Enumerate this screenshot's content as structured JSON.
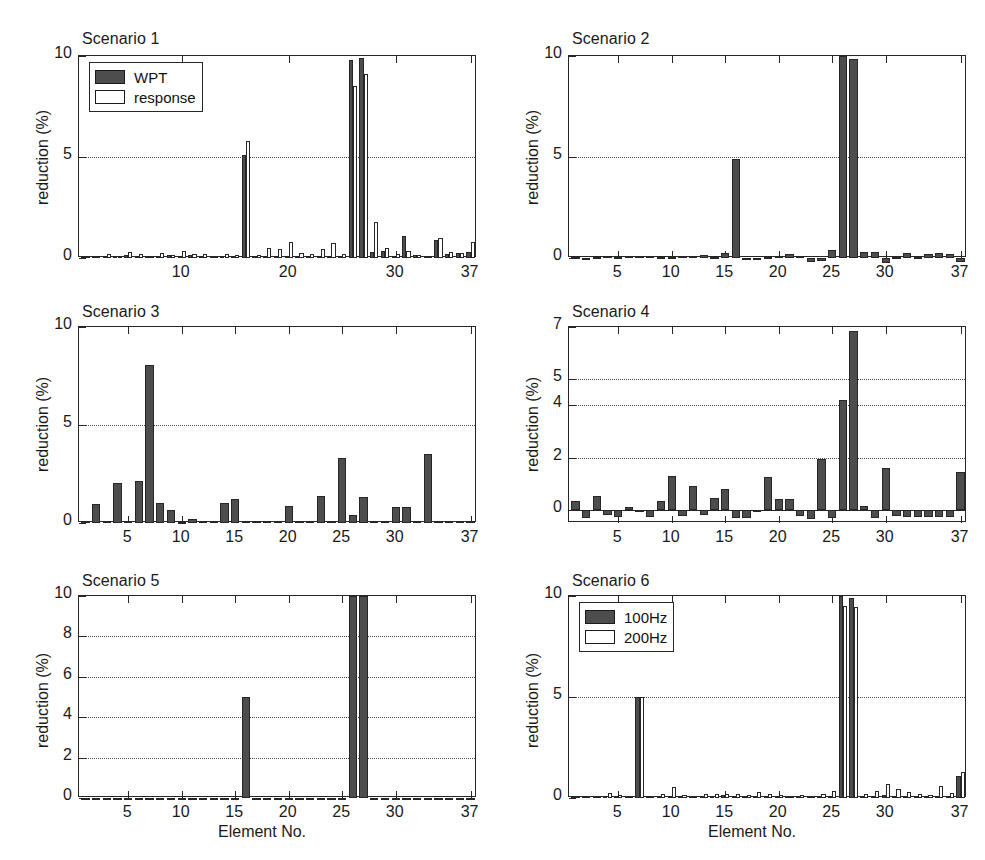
{
  "figure": {
    "width": 985,
    "height": 860,
    "background": "#ffffff",
    "bar_dark_color": "#4d4d4d",
    "bar_light_color": "#ffffff",
    "axis_color": "#262626",
    "grid_color": "#4a4a4a"
  },
  "common": {
    "ylabel": "reduction (%)",
    "xlabel": "Element No.",
    "n_elements": 37
  },
  "chart_data": [
    {
      "type": "bar",
      "title": "Scenario 1",
      "xlabel": "",
      "ylabel": "reduction (%)",
      "ylim": [
        0,
        10
      ],
      "yticks": [
        0,
        5,
        10
      ],
      "ytick_labels": [
        "0",
        "5",
        "10"
      ],
      "xlim": [
        0.4,
        37.6
      ],
      "xticks": [
        10,
        20,
        30,
        37
      ],
      "xtick_labels": [
        "10",
        "20",
        "30",
        "37"
      ],
      "grid": true,
      "gridlines_y": [
        5
      ],
      "legend": {
        "position": "top-left",
        "entries": [
          {
            "label": "WPT",
            "fill": "dark"
          },
          {
            "label": "response",
            "fill": "light"
          }
        ]
      },
      "categories": [
        1,
        2,
        3,
        4,
        5,
        6,
        7,
        8,
        9,
        10,
        11,
        12,
        13,
        14,
        15,
        16,
        17,
        18,
        19,
        20,
        21,
        22,
        23,
        24,
        25,
        26,
        27,
        28,
        29,
        30,
        31,
        32,
        33,
        34,
        35,
        36,
        37
      ],
      "series": [
        {
          "name": "WPT",
          "fill": "dark",
          "values": [
            0.1,
            0.12,
            0.08,
            0.1,
            0.15,
            0.1,
            0.12,
            0.09,
            0.13,
            0.1,
            0.14,
            0.12,
            0.1,
            0.11,
            0.09,
            5.1,
            0.1,
            0.12,
            0.1,
            0.09,
            0.11,
            0.1,
            0.1,
            0.12,
            0.1,
            9.8,
            9.9,
            0.3,
            0.35,
            0.12,
            1.1,
            0.15,
            0.1,
            0.9,
            0.2,
            0.25,
            0.3
          ]
        },
        {
          "name": "response",
          "fill": "light",
          "values": [
            0.08,
            0.1,
            0.2,
            0.12,
            0.3,
            0.18,
            0.12,
            0.25,
            0.15,
            0.35,
            0.2,
            0.18,
            0.12,
            0.22,
            0.15,
            5.8,
            0.15,
            0.5,
            0.45,
            0.8,
            0.25,
            0.2,
            0.45,
            0.75,
            0.2,
            8.5,
            9.1,
            1.8,
            0.5,
            0.2,
            0.35,
            0.15,
            0.1,
            1.0,
            0.3,
            0.25,
            0.8
          ]
        }
      ]
    },
    {
      "type": "bar",
      "title": "Scenario 2",
      "xlabel": "",
      "ylabel": "reduction (%)",
      "ylim": [
        0,
        10
      ],
      "yticks": [
        0,
        5,
        10
      ],
      "ytick_labels": [
        "0",
        "5",
        "10"
      ],
      "xlim": [
        0.4,
        37.6
      ],
      "xticks": [
        5,
        10,
        15,
        20,
        25,
        30,
        37
      ],
      "xtick_labels": [
        "5",
        "10",
        "15",
        "20",
        "25",
        "30",
        "37"
      ],
      "grid": true,
      "gridlines_y": [
        5
      ],
      "legend": null,
      "categories": [
        1,
        2,
        3,
        4,
        5,
        6,
        7,
        8,
        9,
        10,
        11,
        12,
        13,
        14,
        15,
        16,
        17,
        18,
        19,
        20,
        21,
        22,
        23,
        24,
        25,
        26,
        27,
        28,
        29,
        30,
        31,
        32,
        33,
        34,
        35,
        36,
        37
      ],
      "series": [
        {
          "name": "reduction",
          "fill": "dark",
          "values": [
            0.05,
            -0.05,
            0.05,
            0.1,
            0.05,
            0.08,
            0.1,
            0.12,
            0.05,
            0.05,
            0.08,
            0.12,
            0.15,
            0.05,
            0.25,
            4.9,
            -0.12,
            -0.1,
            0.05,
            0.1,
            0.18,
            0.1,
            -0.18,
            -0.15,
            0.4,
            10.0,
            9.85,
            0.3,
            0.28,
            -0.25,
            0.05,
            0.25,
            0.05,
            0.22,
            0.25,
            0.18,
            -0.2
          ]
        }
      ]
    },
    {
      "type": "bar",
      "title": "Scenario 3",
      "xlabel": "",
      "ylabel": "reduction (%)",
      "ylim": [
        0,
        10
      ],
      "yticks": [
        0,
        5,
        10
      ],
      "ytick_labels": [
        "0",
        "5",
        "10"
      ],
      "xlim": [
        0.4,
        37.6
      ],
      "xticks": [
        5,
        10,
        15,
        20,
        25,
        30,
        37
      ],
      "xtick_labels": [
        "5",
        "10",
        "15",
        "20",
        "25",
        "30",
        "37"
      ],
      "grid": true,
      "gridlines_y": [
        5
      ],
      "legend": null,
      "categories": [
        1,
        2,
        3,
        4,
        5,
        6,
        7,
        8,
        9,
        10,
        11,
        12,
        13,
        14,
        15,
        16,
        17,
        18,
        19,
        20,
        21,
        22,
        23,
        24,
        25,
        26,
        27,
        28,
        29,
        30,
        31,
        32,
        33,
        34,
        35,
        36,
        37
      ],
      "series": [
        {
          "name": "reduction",
          "fill": "dark",
          "values": [
            0.08,
            0.95,
            0.1,
            2.05,
            0.08,
            2.15,
            8.05,
            1.0,
            0.65,
            0.05,
            0.18,
            0.12,
            0.1,
            1.0,
            1.25,
            0.08,
            0.08,
            0.1,
            0.08,
            0.85,
            0.08,
            0.1,
            1.4,
            0.1,
            3.3,
            0.4,
            1.35,
            0.1,
            0.12,
            0.8,
            0.8,
            0.08,
            3.5,
            0.1,
            0.1,
            0.1,
            0.08
          ]
        }
      ]
    },
    {
      "type": "bar",
      "title": "Scenario 4",
      "xlabel": "",
      "ylabel": "reduction (%)",
      "ylim": [
        -0.5,
        7
      ],
      "yticks": [
        0,
        2,
        4,
        5,
        7
      ],
      "ytick_labels": [
        "0",
        "2",
        "4",
        "5",
        "7"
      ],
      "xlim": [
        0.4,
        37.6
      ],
      "xticks": [
        5,
        10,
        15,
        20,
        25,
        30,
        37
      ],
      "xtick_labels": [
        "5",
        "10",
        "15",
        "20",
        "25",
        "30",
        "37"
      ],
      "grid": true,
      "gridlines_y": [
        2,
        4,
        5
      ],
      "legend": null,
      "categories": [
        1,
        2,
        3,
        4,
        5,
        6,
        7,
        8,
        9,
        10,
        11,
        12,
        13,
        14,
        15,
        16,
        17,
        18,
        19,
        20,
        21,
        22,
        23,
        24,
        25,
        26,
        27,
        28,
        29,
        30,
        31,
        32,
        33,
        34,
        35,
        36,
        37
      ],
      "series": [
        {
          "name": "reduction",
          "fill": "dark",
          "values": [
            0.35,
            -0.3,
            0.55,
            -0.18,
            -0.28,
            0.1,
            -0.05,
            -0.28,
            0.35,
            1.3,
            -0.25,
            0.9,
            -0.2,
            0.45,
            0.8,
            -0.32,
            -0.3,
            -0.05,
            1.25,
            0.4,
            0.4,
            -0.25,
            -0.35,
            1.95,
            -0.3,
            4.2,
            6.85,
            0.15,
            -0.32,
            1.6,
            -0.25,
            -0.28,
            -0.28,
            -0.28,
            -0.28,
            -0.28,
            1.45
          ]
        }
      ]
    },
    {
      "type": "bar",
      "title": "Scenario 5",
      "xlabel": "Element No.",
      "ylabel": "reduction (%)",
      "ylim": [
        0,
        10
      ],
      "yticks": [
        0,
        2,
        4,
        6,
        8,
        10
      ],
      "ytick_labels": [
        "0",
        "2",
        "4",
        "6",
        "8",
        "10"
      ],
      "xlim": [
        0.4,
        37.6
      ],
      "xticks": [
        5,
        10,
        15,
        20,
        25,
        30,
        37
      ],
      "xtick_labels": [
        "5",
        "10",
        "15",
        "20",
        "25",
        "30",
        "37"
      ],
      "grid": true,
      "gridlines_y": [
        2,
        4,
        6,
        8
      ],
      "legend": null,
      "categories": [
        1,
        2,
        3,
        4,
        5,
        6,
        7,
        8,
        9,
        10,
        11,
        12,
        13,
        14,
        15,
        16,
        17,
        18,
        19,
        20,
        21,
        22,
        23,
        24,
        25,
        26,
        27,
        28,
        29,
        30,
        31,
        32,
        33,
        34,
        35,
        36,
        37
      ],
      "series": [
        {
          "name": "reduction",
          "fill": "dark",
          "values": [
            0,
            0,
            0,
            0,
            0,
            0,
            0,
            0,
            0,
            0,
            0,
            0,
            0,
            0,
            0,
            5.0,
            0,
            0,
            0,
            0,
            0,
            0,
            0,
            0,
            0,
            10.0,
            10.0,
            0,
            0,
            0,
            0,
            0,
            0,
            0,
            0,
            0,
            0
          ]
        }
      ]
    },
    {
      "type": "bar",
      "title": "Scenario 6",
      "xlabel": "Element No.",
      "ylabel": "reduction (%)",
      "ylim": [
        0,
        10
      ],
      "yticks": [
        0,
        5,
        10
      ],
      "ytick_labels": [
        "0",
        "5",
        "10"
      ],
      "xlim": [
        0.4,
        37.6
      ],
      "xticks": [
        5,
        10,
        15,
        20,
        25,
        30,
        37
      ],
      "xtick_labels": [
        "5",
        "10",
        "15",
        "20",
        "25",
        "30",
        "37"
      ],
      "grid": true,
      "gridlines_y": [
        5
      ],
      "legend": {
        "position": "top-left",
        "entries": [
          {
            "label": "100Hz",
            "fill": "dark"
          },
          {
            "label": "200Hz",
            "fill": "light"
          }
        ]
      },
      "categories": [
        1,
        2,
        3,
        4,
        5,
        6,
        7,
        8,
        9,
        10,
        11,
        12,
        13,
        14,
        15,
        16,
        17,
        18,
        19,
        20,
        21,
        22,
        23,
        24,
        25,
        26,
        27,
        28,
        29,
        30,
        31,
        32,
        33,
        34,
        35,
        36,
        37
      ],
      "series": [
        {
          "name": "100Hz",
          "fill": "dark",
          "values": [
            0.08,
            0.1,
            0.08,
            0.12,
            0.1,
            0.08,
            5.0,
            0.1,
            0.08,
            0.12,
            0.1,
            0.08,
            0.1,
            0.12,
            0.15,
            0.1,
            0.08,
            0.12,
            0.1,
            0.08,
            0.1,
            0.08,
            0.1,
            0.12,
            0.1,
            10.0,
            9.9,
            0.1,
            0.12,
            0.15,
            0.1,
            0.12,
            0.1,
            0.08,
            0.1,
            0.12,
            1.1
          ]
        },
        {
          "name": "200Hz",
          "fill": "light",
          "values": [
            0.1,
            0.12,
            0.1,
            0.25,
            0.15,
            0.12,
            5.0,
            0.12,
            0.18,
            0.55,
            0.15,
            0.12,
            0.18,
            0.2,
            0.22,
            0.18,
            0.15,
            0.3,
            0.18,
            0.15,
            0.12,
            0.15,
            0.12,
            0.18,
            0.35,
            9.5,
            9.45,
            0.2,
            0.35,
            0.7,
            0.45,
            0.3,
            0.18,
            0.15,
            0.6,
            0.25,
            1.3
          ]
        }
      ]
    }
  ]
}
